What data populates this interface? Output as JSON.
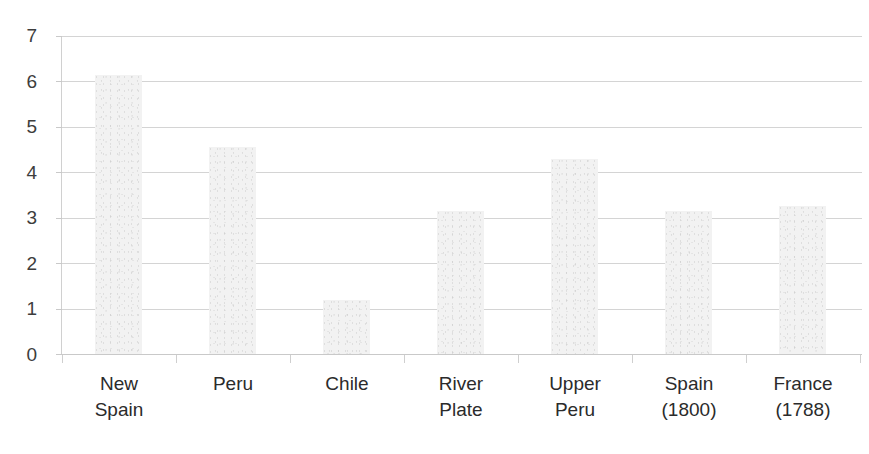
{
  "chart_data": {
    "type": "bar",
    "title": "",
    "subtitle": "",
    "xlabel": "",
    "ylabel": "",
    "ylim": [
      0,
      7
    ],
    "ytick_labels": [
      "7",
      "6",
      "5",
      "4",
      "3",
      "2",
      "1",
      "0"
    ],
    "yticks": [
      7,
      6,
      5,
      4,
      3,
      2,
      1,
      0
    ],
    "grid": true,
    "legend": null,
    "legend_position": "none",
    "categories": [
      "New\nSpain",
      "Peru",
      "Chile",
      "River\nPlate",
      "Upper\nPeru",
      "Spain\n(1800)",
      "France\n(1788)"
    ],
    "category_labels_flat": [
      "New Spain",
      "Peru",
      "Chile",
      "River Plate",
      "Upper Peru",
      "Spain (1800)",
      "France (1788)"
    ],
    "values": [
      6.15,
      4.55,
      1.2,
      3.15,
      4.3,
      3.15,
      3.25
    ],
    "bar_color": "#f2f2f2",
    "gridline_color": "#d4d4d4",
    "axis_color": "#c9c9c9",
    "tick_label_color": "#3d3d3d",
    "category_label_color": "#2b2b2b",
    "background_color": "#ffffff",
    "annotations": []
  }
}
